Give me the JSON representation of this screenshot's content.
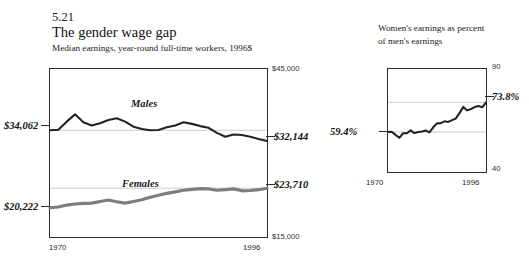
{
  "figure": {
    "number": "5.21",
    "title": "The gender wage gap",
    "subtitle": "Median earnings, year-round full-time workers, 1996$"
  },
  "right_panel": {
    "heading_line1": "Women's earnings as percent",
    "heading_line2": "of men's earnings"
  },
  "labels": {
    "males": "Males",
    "females": "Females",
    "males_start_value": "$34,062",
    "males_end_value": "$32,144",
    "females_start_value": "$20,222",
    "females_end_value": "$23,710",
    "ratio_start_value": "59.4%",
    "ratio_end_value": "73.8%",
    "left_axis_top": "$45,000",
    "left_axis_bottom": "$15,000",
    "right_axis_top": "90",
    "right_axis_bottom": "40",
    "x_start": "1970",
    "x_end": "1996"
  },
  "colors": {
    "males_line": "#232323",
    "females_line": "#7d7d7d",
    "ratio_line": "#232323",
    "gridline": "#bdbdbd",
    "frame": "#2b2b2b",
    "background": "#ffffff"
  },
  "chart_data": [
    {
      "type": "line",
      "title": "The gender wage gap",
      "subtitle": "Median earnings, year-round full-time workers, 1996$",
      "xlabel": "",
      "ylabel": "Median earnings (1996 dollars)",
      "xlim": [
        1970,
        1996
      ],
      "ylim": [
        15000,
        45000
      ],
      "grid": true,
      "gridlines_y": [
        34062,
        23710
      ],
      "legend": "inline-labels",
      "x": [
        1970,
        1971,
        1972,
        1973,
        1974,
        1975,
        1976,
        1977,
        1978,
        1979,
        1980,
        1981,
        1982,
        1983,
        1984,
        1985,
        1986,
        1987,
        1988,
        1989,
        1990,
        1991,
        1992,
        1993,
        1994,
        1995,
        1996
      ],
      "series": [
        {
          "name": "Males",
          "color": "#232323",
          "values": [
            34062,
            34150,
            35600,
            36900,
            35500,
            34900,
            35300,
            35900,
            36200,
            35600,
            34700,
            34300,
            34050,
            34100,
            34600,
            34900,
            35500,
            35200,
            34800,
            34500,
            33600,
            32900,
            33300,
            33200,
            32900,
            32500,
            32144
          ]
        },
        {
          "name": "Females",
          "color": "#7d7d7d",
          "values": [
            20222,
            20350,
            20700,
            20900,
            21000,
            21050,
            21350,
            21600,
            21300,
            21050,
            21350,
            21650,
            22100,
            22450,
            22800,
            23050,
            23350,
            23500,
            23650,
            23600,
            23350,
            23450,
            23600,
            23250,
            23300,
            23450,
            23710
          ]
        }
      ],
      "annotations": [
        {
          "text": "$34,062",
          "series": "Males",
          "position": "start-left"
        },
        {
          "text": "$32,144",
          "series": "Males",
          "position": "end-right"
        },
        {
          "text": "$20,222",
          "series": "Females",
          "position": "start-left"
        },
        {
          "text": "$23,710",
          "series": "Females",
          "position": "end-right"
        },
        {
          "text": "$45,000",
          "position": "axis-top-right"
        },
        {
          "text": "$15,000",
          "position": "axis-bottom-right"
        }
      ]
    },
    {
      "type": "line",
      "title": "Women's earnings as percent of men's earnings",
      "xlabel": "",
      "ylabel": "Percent",
      "xlim": [
        1970,
        1996
      ],
      "ylim": [
        40,
        90
      ],
      "grid": true,
      "gridlines_y": [
        73.8,
        59.4
      ],
      "x": [
        1970,
        1971,
        1972,
        1973,
        1974,
        1975,
        1976,
        1977,
        1978,
        1979,
        1980,
        1981,
        1982,
        1983,
        1984,
        1985,
        1986,
        1987,
        1988,
        1989,
        1990,
        1991,
        1992,
        1993,
        1994,
        1995,
        1996
      ],
      "series": [
        {
          "name": "Women's earnings as percent of men's earnings",
          "color": "#232323",
          "values": [
            59.4,
            59.5,
            58.0,
            56.6,
            58.8,
            58.8,
            60.2,
            58.9,
            59.4,
            59.7,
            60.2,
            59.2,
            61.7,
            63.6,
            63.7,
            64.6,
            64.3,
            65.2,
            66.0,
            68.7,
            71.6,
            69.9,
            70.6,
            71.5,
            72.0,
            71.4,
            73.8
          ]
        }
      ],
      "annotations": [
        {
          "text": "59.4%",
          "position": "start-left"
        },
        {
          "text": "73.8%",
          "position": "end-right"
        },
        {
          "text": "90",
          "position": "axis-top-right"
        },
        {
          "text": "40",
          "position": "axis-bottom-right"
        }
      ]
    }
  ]
}
